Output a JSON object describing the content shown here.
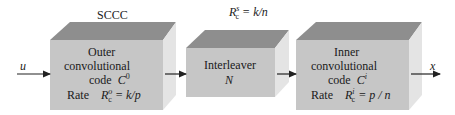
{
  "title": "SCCC",
  "input_label": "u",
  "output_label": "x",
  "interleaver_rate": {
    "symbol": "R",
    "sub": "c",
    "sup": "s",
    "expr": "= k/n"
  },
  "blocks": [
    {
      "name": "outer-encoder",
      "line1": "Outer",
      "line2": "convolutional",
      "line3_text": "code",
      "line3_symbol": "C",
      "line3_sup": "0",
      "rate_label": "Rate",
      "rate_symbol": "R",
      "rate_sub": "c",
      "rate_sup": "o",
      "rate_expr": "= k/p"
    },
    {
      "name": "interleaver",
      "line1": "Interleaver",
      "line2": "N"
    },
    {
      "name": "inner-encoder",
      "line1": "Inner",
      "line2": "convolutional",
      "line3_text": "code",
      "line3_symbol": "C",
      "line3_sup": "i",
      "rate_label": "Rate",
      "rate_symbol": "R",
      "rate_sub": "c",
      "rate_sup": "i",
      "rate_expr": "= p / n"
    }
  ],
  "colors": {
    "front": "#c6c6c6",
    "top": "#8e8e8e",
    "side": "#e4e4e4",
    "arrow": "#222222"
  }
}
